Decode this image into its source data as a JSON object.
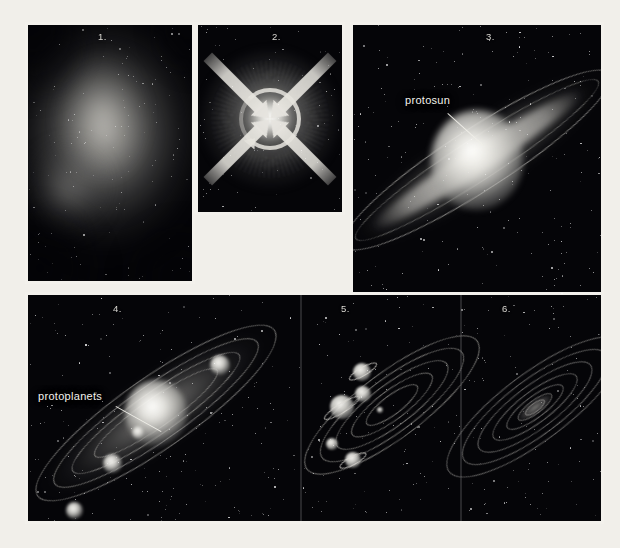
{
  "figure": {
    "background_color": "#f1efea",
    "panel_background_color": "#050508",
    "panel_border_color": "#f3f1ec",
    "label_text_color": "#f2f1ec"
  },
  "panels": [
    {
      "id": "panel-1",
      "number": "1.",
      "caption": "",
      "description": "interstellar gas and dust cloud (nebula)"
    },
    {
      "id": "panel-2",
      "number": "2.",
      "caption": "",
      "description": "cloud collapses inward and begins to rotate"
    },
    {
      "id": "panel-3",
      "number": "3.",
      "caption": "protosun",
      "description": "flattened rotating disk with hot central protosun"
    },
    {
      "id": "panel-4",
      "number": "4.",
      "caption": "protoplanets",
      "description": "protoplanets condense from the disk"
    },
    {
      "id": "panel-5",
      "number": "5.",
      "caption": "",
      "description": "planets sweep up remaining material along orbits"
    },
    {
      "id": "panel-6",
      "number": "6.",
      "caption": "",
      "description": "mature solar system of planetary orbits"
    }
  ],
  "callouts": [
    {
      "id": "protosun-callout",
      "text": "protosun"
    },
    {
      "id": "protoplanets-callout",
      "text": "protoplanets"
    }
  ]
}
